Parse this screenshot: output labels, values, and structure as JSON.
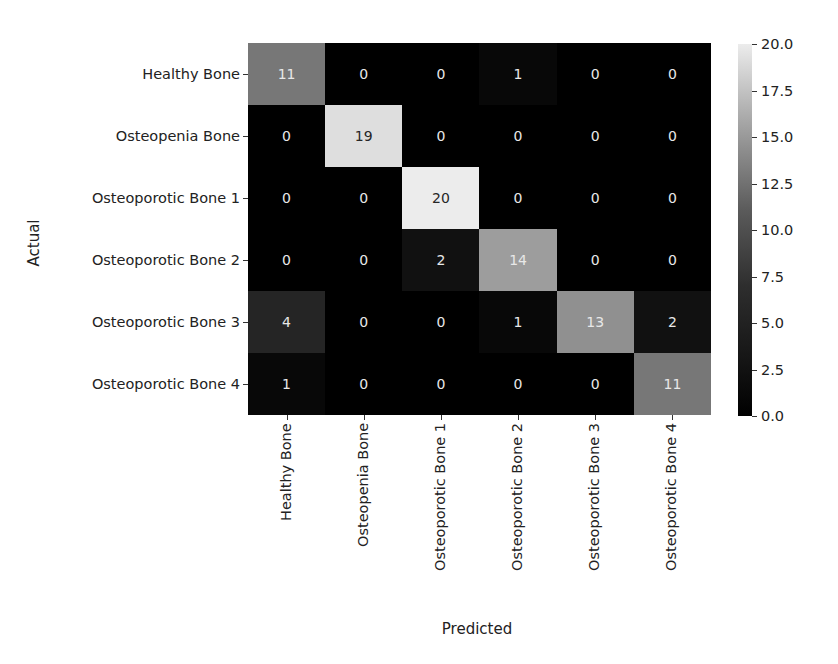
{
  "chart_data": {
    "type": "heatmap",
    "title": "",
    "xlabel": "Predicted",
    "ylabel": "Actual",
    "x_categories": [
      "Healthy Bone",
      "Osteopenia Bone",
      "Osteoporotic Bone 1",
      "Osteoporotic Bone 2",
      "Osteoporotic Bone 3",
      "Osteoporotic Bone 4"
    ],
    "y_categories": [
      "Healthy Bone",
      "Osteopenia Bone",
      "Osteoporotic Bone 1",
      "Osteoporotic Bone 2",
      "Osteoporotic Bone 3",
      "Osteoporotic Bone 4"
    ],
    "matrix": [
      [
        11,
        0,
        0,
        1,
        0,
        0
      ],
      [
        0,
        19,
        0,
        0,
        0,
        0
      ],
      [
        0,
        0,
        20,
        0,
        0,
        0
      ],
      [
        0,
        0,
        2,
        14,
        0,
        0
      ],
      [
        4,
        0,
        0,
        1,
        13,
        2
      ],
      [
        1,
        0,
        0,
        0,
        0,
        11
      ]
    ],
    "colorbar": {
      "range": [
        0.0,
        20.0
      ],
      "ticks": [
        "0.0",
        "2.5",
        "5.0",
        "7.5",
        "10.0",
        "12.5",
        "15.0",
        "17.5",
        "20.0"
      ],
      "colormap": "grayscale (black to light gray)",
      "low_color": "#000000",
      "high_color": "#ececec"
    },
    "grid": false,
    "legend_position": "right (colorbar)"
  }
}
